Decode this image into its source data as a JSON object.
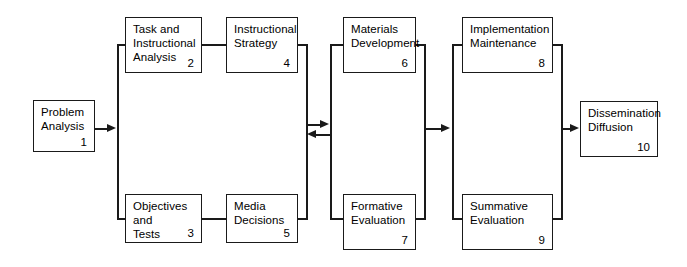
{
  "diagram": {
    "background_color": "#ffffff",
    "line_color": "#1a1a1a",
    "text_color": "#000000",
    "nodes": [
      {
        "id": "problem-analysis",
        "label": "Problem\nAnalysis",
        "number": "1",
        "x": 33,
        "y": 100,
        "w": 62,
        "h": 52
      },
      {
        "id": "task-instructional-analysis",
        "label": "Task and\nInstructional\nAnalysis",
        "number": "2",
        "x": 125,
        "y": 17,
        "w": 77,
        "h": 56
      },
      {
        "id": "objectives-and-tests",
        "label": "Objectives\nand\nTests",
        "number": "3",
        "x": 125,
        "y": 194,
        "w": 77,
        "h": 49
      },
      {
        "id": "instructional-strategy",
        "label": "Instructional\nStrategy",
        "number": "4",
        "x": 226,
        "y": 17,
        "w": 72,
        "h": 56
      },
      {
        "id": "media-decisions",
        "label": "Media\nDecisions",
        "number": "5",
        "x": 226,
        "y": 194,
        "w": 72,
        "h": 49
      },
      {
        "id": "materials-development",
        "label": "Materials\nDevelopment",
        "number": "6",
        "x": 343,
        "y": 17,
        "w": 73,
        "h": 56
      },
      {
        "id": "formative-evaluation",
        "label": "Formative\nEvaluation",
        "number": "7",
        "x": 343,
        "y": 194,
        "w": 73,
        "h": 56
      },
      {
        "id": "implementation-maintenance",
        "label": "Implementation\nMaintenance",
        "number": "8",
        "x": 462,
        "y": 17,
        "w": 91,
        "h": 56
      },
      {
        "id": "summative-evaluation",
        "label": "Summative\nEvaluation",
        "number": "9",
        "x": 462,
        "y": 194,
        "w": 91,
        "h": 56
      },
      {
        "id": "dissemination-diffusion",
        "label": "Dissemination\nDiffusion",
        "number": "10",
        "x": 580,
        "y": 101,
        "w": 78,
        "h": 56
      }
    ],
    "connectors": [
      {
        "id": "task-to-strategy",
        "from": "task-instructional-analysis",
        "to": "instructional-strategy",
        "kind": "line"
      },
      {
        "id": "objectives-to-media",
        "from": "objectives-and-tests",
        "to": "media-decisions",
        "kind": "line"
      },
      {
        "id": "problem-to-design-rail",
        "from": "problem-analysis",
        "to": "design-rail",
        "kind": "arrow-right"
      },
      {
        "id": "design-to-materials",
        "from": "design-rail",
        "to": "materials-rail",
        "kind": "arrow-right"
      },
      {
        "id": "materials-to-design",
        "from": "materials-rail",
        "to": "design-rail",
        "kind": "arrow-left"
      },
      {
        "id": "materials-to-implementation",
        "from": "materials-rail",
        "to": "implementation-rail",
        "kind": "arrow-right"
      },
      {
        "id": "implementation-to-dissemination",
        "from": "implementation-rail",
        "to": "dissemination-diffusion",
        "kind": "arrow-right"
      }
    ]
  }
}
